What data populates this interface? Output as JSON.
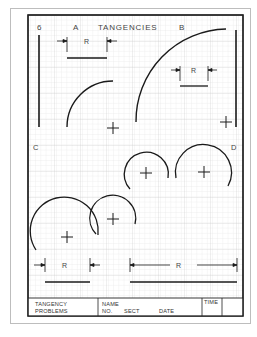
{
  "sheet": {
    "number": "6",
    "title": "TANGENCIES",
    "quadrant_labels": {
      "a": "A",
      "b": "B",
      "c": "C",
      "d": "D"
    },
    "dimension_label": "R"
  },
  "title_block": {
    "problem_line1": "TANGENCY",
    "problem_line2": "PROBLEMS",
    "name_label": "NAME",
    "no_label": "NO.",
    "sect_label": "SECT",
    "date_label": "DATE",
    "time_label": "TIME"
  },
  "colors": {
    "ink": "#1a1a1a",
    "grid_minor": "#dcdcdc",
    "grid_major": "#c4c4c4",
    "label": "#555555",
    "page_border": "#bdbdbd"
  },
  "drawing": {
    "frame": {
      "x": 28,
      "y": 15,
      "w": 215,
      "h": 301
    },
    "grid_spacing": 5.2,
    "problem_a": {
      "vertical_line": {
        "x": 39,
        "y1": 35,
        "y2": 127
      },
      "arc": {
        "cx": 113,
        "cy": 127,
        "r": 46
      },
      "center_mark": {
        "x": 113,
        "y": 128
      },
      "dimension": {
        "x1": 67,
        "x2": 107,
        "y_label": 41,
        "y_line": 58
      }
    },
    "problem_b": {
      "vertical_line": {
        "x": 236,
        "y1": 30,
        "y2": 127
      },
      "arc": {
        "cx": 228,
        "cy": 122,
        "r": 92
      },
      "center_mark": {
        "x": 226,
        "y": 122
      },
      "dimension": {
        "x1": 180,
        "x2": 208,
        "y_label": 70,
        "y_line": 86
      }
    },
    "problem_d": {
      "arcs": [
        {
          "cx": 146,
          "cy": 173,
          "r": 22
        },
        {
          "cx": 204,
          "cy": 172,
          "r": 28
        }
      ]
    },
    "problem_c": {
      "arcs": [
        {
          "cx": 67,
          "cy": 237,
          "r": 34
        },
        {
          "cx": 113,
          "cy": 219,
          "r": 23
        }
      ],
      "dimension_small": {
        "x1": 45,
        "x2": 90,
        "y_label": 265,
        "y_line": 282
      },
      "dimension_large": {
        "x1": 130,
        "x2": 237,
        "y_label": 265,
        "y_line": 282
      }
    }
  }
}
